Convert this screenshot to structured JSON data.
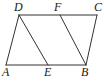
{
  "figure": {
    "kind": "geometry-diagram",
    "stroke_color": "#333333",
    "background_color": "#ffffff",
    "label_color": "#1a1a1a",
    "stroke_width": 1,
    "canvas": {
      "width": 104,
      "height": 81
    },
    "vertices": [
      {
        "name": "D",
        "label": "D",
        "x": 19,
        "y": 15,
        "label_x": 14,
        "label_y": 1
      },
      {
        "name": "F",
        "label": "F",
        "x": 60,
        "y": 15,
        "label_x": 54,
        "label_y": 1
      },
      {
        "name": "C",
        "label": "C",
        "x": 97,
        "y": 15,
        "label_x": 94,
        "label_y": 1
      },
      {
        "name": "A",
        "label": "A",
        "x": 6,
        "y": 65,
        "label_x": 2,
        "label_y": 66
      },
      {
        "name": "E",
        "label": "E",
        "x": 48,
        "y": 65,
        "label_x": 44,
        "label_y": 66
      },
      {
        "name": "B",
        "label": "B",
        "x": 86,
        "y": 65,
        "label_x": 81,
        "label_y": 66
      }
    ],
    "segments": [
      {
        "name": "side-DC-top",
        "from": "D",
        "to": "C",
        "points": "19,15 97,15"
      },
      {
        "name": "side-AB-bottom",
        "from": "A",
        "to": "B",
        "points": "6,65 86,65"
      },
      {
        "name": "side-AD-left",
        "from": "A",
        "to": "D",
        "points": "6,65 19,15"
      },
      {
        "name": "side-BC-right",
        "from": "B",
        "to": "C",
        "points": "86,65 97,15"
      },
      {
        "name": "segment-DE",
        "from": "D",
        "to": "E",
        "points": "19,15 48,65"
      },
      {
        "name": "segment-FB",
        "from": "F",
        "to": "B",
        "points": "60,15 86,65"
      }
    ]
  }
}
